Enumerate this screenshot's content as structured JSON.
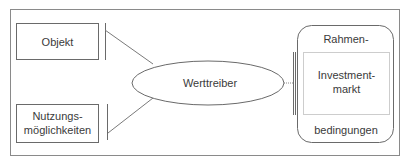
{
  "diagram": {
    "nodes": {
      "objekt": "Objekt",
      "nutzung_line1": "Nutzungs-",
      "nutzung_line2": "möglichkeiten",
      "werttreiber": "Werttreiber",
      "rahmen_top": "Rahmen-",
      "rahmen_bottom": "bedingungen",
      "investment_line1": "Investment-",
      "investment_line2": "markt"
    },
    "colors": {
      "stroke": "#6a6a6a",
      "text": "#3a3a3a"
    }
  }
}
